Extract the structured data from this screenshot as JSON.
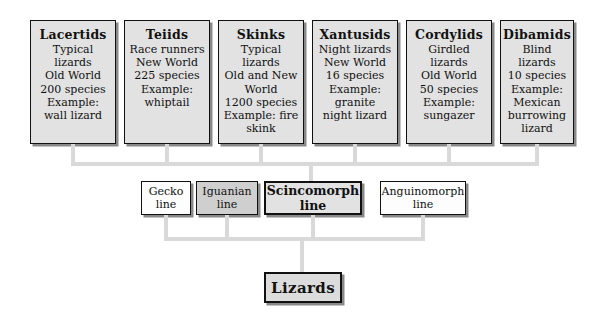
{
  "diagram": {
    "background_color": "#ffffff",
    "connector_color": "#d9d9d9",
    "families": [
      {
        "name": "Lacertids",
        "lines": [
          "Typical lizards",
          "Old World",
          "200 species",
          "Example:",
          "wall lizard"
        ],
        "fill": "#e2e2e2"
      },
      {
        "name": "Teiids",
        "lines": [
          "Race runners",
          "New World",
          "225 species",
          "Example:",
          "whiptail"
        ],
        "fill": "#e2e2e2"
      },
      {
        "name": "Skinks",
        "lines": [
          "Typical lizards",
          "Old and New",
          "World",
          "1200 species",
          "Example: fire",
          "skink"
        ],
        "fill": "#e2e2e2"
      },
      {
        "name": "Xantusids",
        "lines": [
          "Night lizards",
          "New World",
          "16 species",
          "Example:",
          "granite",
          "night lizard"
        ],
        "fill": "#e2e2e2"
      },
      {
        "name": "Cordylids",
        "lines": [
          "Girdled lizards",
          "Old World",
          "50 species",
          "Example:",
          "sungazer"
        ],
        "fill": "#e2e2e2"
      },
      {
        "name": "Dibamids",
        "lines": [
          "Blind lizards",
          "10 species",
          "Example:",
          "Mexican",
          "burrowing",
          "lizard"
        ],
        "fill": "#e2e2e2"
      }
    ],
    "lineages": [
      {
        "label": "Gecko line",
        "style": "plain",
        "fill": "#fdfdfd"
      },
      {
        "label": "Iguanian line",
        "style": "shaded",
        "fill": "#cfcfcf"
      },
      {
        "label": "Scincomorph line",
        "style": "strong",
        "fill": "#e2e2e2"
      },
      {
        "label": "Anguinomorph line",
        "style": "plain",
        "fill": "#fdfdfd"
      }
    ],
    "root": {
      "label": "Lizards",
      "fill": "#dcdcdc"
    }
  }
}
